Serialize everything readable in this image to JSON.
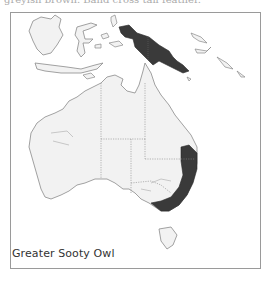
{
  "caption_cutoff": "greyish brown. Band cross tail feather.",
  "map": {
    "species_label": "Greater Sooty Owl",
    "colors": {
      "land": "#f2f2f2",
      "coastline": "#8a8a8a",
      "range": "#3a3a3a",
      "borders": "#888888",
      "frame": "#9a9a9a"
    },
    "regions": [
      "Indonesia",
      "New Guinea",
      "Australia",
      "Tasmania"
    ],
    "range_areas": [
      "New Guinea",
      "Eastern Australia coast"
    ]
  }
}
